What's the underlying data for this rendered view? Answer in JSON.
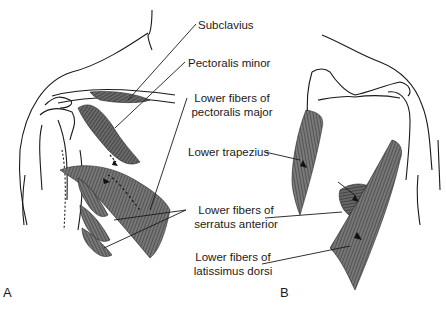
{
  "figure": {
    "panels": [
      {
        "letter": "A",
        "view": "anterior shoulder",
        "labels": [
          {
            "id": "subclavius",
            "text": "Subclavius"
          },
          {
            "id": "pectoralis-minor",
            "text": "Pectoralis minor"
          },
          {
            "id": "lower-pec-major",
            "line1": "Lower fibers of",
            "line2": "pectoralis major"
          },
          {
            "id": "lower-serratus",
            "line1": "Lower fibers of",
            "line2": "serratus anterior"
          }
        ]
      },
      {
        "letter": "B",
        "view": "posterior shoulder",
        "labels": [
          {
            "id": "lower-trapezius",
            "text": "Lower trapezius"
          },
          {
            "id": "lower-latissimus",
            "line1": "Lower fibers of",
            "line2": "latissimus dorsi"
          }
        ]
      }
    ],
    "colors": {
      "background": "#ffffff",
      "outline": "#1a1a1a",
      "muscle_fill": "#6e6e6e",
      "muscle_dark": "#3a3a3a",
      "muscle_light": "#9a9a9a",
      "text": "#1a1a1a"
    }
  }
}
